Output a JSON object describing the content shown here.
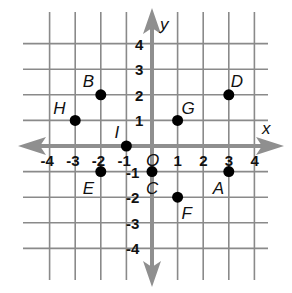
{
  "chart_data": {
    "type": "scatter",
    "title": "",
    "xlabel": "x",
    "ylabel": "y",
    "xlim": [
      -4,
      4
    ],
    "ylim": [
      -4,
      4
    ],
    "grid": true,
    "origin_label": "O",
    "x_ticks": [
      "-4",
      "-3",
      "-2",
      "-1",
      "1",
      "2",
      "3",
      "4"
    ],
    "y_ticks": [
      "4",
      "3",
      "2",
      "1",
      "-1",
      "-2",
      "-3",
      "-4"
    ],
    "points": [
      {
        "label": "A",
        "x": 3,
        "y": -1
      },
      {
        "label": "B",
        "x": -2,
        "y": 2
      },
      {
        "label": "C",
        "x": 0,
        "y": -1
      },
      {
        "label": "D",
        "x": 3,
        "y": 2
      },
      {
        "label": "E",
        "x": -2,
        "y": -1
      },
      {
        "label": "F",
        "x": 1,
        "y": -2
      },
      {
        "label": "G",
        "x": 1,
        "y": 1
      },
      {
        "label": "H",
        "x": -3,
        "y": 1
      },
      {
        "label": "I",
        "x": -1,
        "y": 0
      }
    ]
  },
  "colors": {
    "grid": "#8a8a8a",
    "axis": "#8f8f8f",
    "point": "#000000",
    "text": "#111111"
  }
}
